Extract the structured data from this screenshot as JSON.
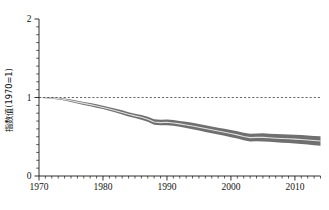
{
  "chart_data": {
    "type": "line",
    "title": "",
    "subtitle": "",
    "xlabel": "",
    "ylabel": "指数值(1970=1)",
    "xlim": [
      1970,
      2014
    ],
    "ylim": [
      0,
      2
    ],
    "grid": false,
    "legend": null,
    "x_ticks_major": [
      1970,
      1980,
      1990,
      2000,
      2010
    ],
    "x_tick_labels": [
      "1970",
      "1980",
      "1990",
      "2000",
      "2010"
    ],
    "x_minor_tick_step": 1,
    "y_ticks_major": [
      0,
      1,
      2
    ],
    "y_tick_labels": [
      "0",
      "1",
      "2"
    ],
    "y_minor_tick_step": 0.1,
    "reference_line": {
      "orientation": "horizontal",
      "value": 1,
      "style": "dashed",
      "label": ""
    },
    "series": [
      {
        "name": "指数值",
        "style": "line-with-confidence-band",
        "line_color": "#e2e2e2",
        "band_color": "#6f6f6f",
        "x": [
          1970,
          1971,
          1972,
          1973,
          1974,
          1975,
          1976,
          1977,
          1978,
          1979,
          1980,
          1981,
          1982,
          1983,
          1984,
          1985,
          1986,
          1987,
          1988,
          1989,
          1990,
          1991,
          1992,
          1993,
          1994,
          1995,
          1996,
          1997,
          1998,
          1999,
          2000,
          2001,
          2002,
          2003,
          2004,
          2005,
          2006,
          2007,
          2008,
          2009,
          2010,
          2011,
          2012,
          2013,
          2014
        ],
        "values": [
          1.0,
          0.998,
          0.993,
          0.987,
          0.974,
          0.958,
          0.941,
          0.925,
          0.909,
          0.892,
          0.874,
          0.854,
          0.832,
          0.81,
          0.786,
          0.766,
          0.748,
          0.724,
          0.688,
          0.68,
          0.684,
          0.676,
          0.664,
          0.651,
          0.637,
          0.621,
          0.604,
          0.588,
          0.572,
          0.557,
          0.541,
          0.524,
          0.504,
          0.489,
          0.492,
          0.492,
          0.487,
          0.482,
          0.478,
          0.474,
          0.47,
          0.464,
          0.458,
          0.452,
          0.446
        ],
        "lower": [
          0.996,
          0.992,
          0.985,
          0.976,
          0.961,
          0.943,
          0.924,
          0.906,
          0.889,
          0.871,
          0.852,
          0.831,
          0.808,
          0.784,
          0.759,
          0.738,
          0.718,
          0.692,
          0.654,
          0.645,
          0.648,
          0.639,
          0.626,
          0.612,
          0.597,
          0.58,
          0.562,
          0.545,
          0.528,
          0.512,
          0.495,
          0.477,
          0.456,
          0.44,
          0.442,
          0.441,
          0.435,
          0.429,
          0.424,
          0.419,
          0.414,
          0.407,
          0.4,
          0.393,
          0.386
        ],
        "upper": [
          1.004,
          1.004,
          1.001,
          0.998,
          0.987,
          0.973,
          0.958,
          0.944,
          0.929,
          0.913,
          0.896,
          0.877,
          0.856,
          0.836,
          0.813,
          0.794,
          0.778,
          0.756,
          0.722,
          0.715,
          0.72,
          0.713,
          0.702,
          0.69,
          0.677,
          0.662,
          0.646,
          0.631,
          0.616,
          0.602,
          0.587,
          0.571,
          0.552,
          0.538,
          0.542,
          0.543,
          0.539,
          0.535,
          0.532,
          0.529,
          0.526,
          0.521,
          0.516,
          0.511,
          0.506
        ]
      }
    ]
  }
}
